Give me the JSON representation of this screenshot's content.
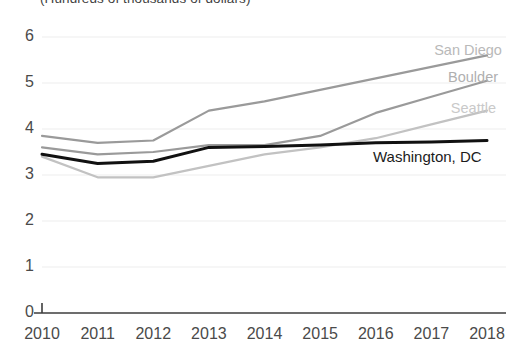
{
  "caption": {
    "units_text": "(Hundreds of thousands of dollars)"
  },
  "chart_data": {
    "type": "line",
    "title": "",
    "subtitle": "(Hundreds of thousands of dollars)",
    "xlabel": "",
    "ylabel": "",
    "x": [
      2010,
      2011,
      2012,
      2013,
      2014,
      2015,
      2016,
      2017,
      2018
    ],
    "categories": [
      "2010",
      "2011",
      "2012",
      "2013",
      "2014",
      "2015",
      "2016",
      "2017",
      "2018"
    ],
    "xlim": [
      2010,
      2018
    ],
    "ylim": [
      0,
      6
    ],
    "yticks": [
      0,
      1,
      2,
      3,
      4,
      5,
      6
    ],
    "ytick_labels": [
      "0",
      "1",
      "2",
      "3",
      "4",
      "5",
      "6"
    ],
    "grid": "horizontal",
    "legend_position": "inline-right",
    "series": [
      {
        "name": "San Diego",
        "color": "#9a9a9a",
        "label_color": "#b9b9b9",
        "width": 2.2,
        "values": [
          3.85,
          3.7,
          3.75,
          4.4,
          4.6,
          4.85,
          5.1,
          5.35,
          5.6
        ]
      },
      {
        "name": "Boulder",
        "color": "#9a9a9a",
        "label_color": "#b0b0b0",
        "width": 2.2,
        "values": [
          3.6,
          3.45,
          3.5,
          3.65,
          3.65,
          3.85,
          4.35,
          4.7,
          5.05
        ]
      },
      {
        "name": "Seattle",
        "color": "#c2c2c2",
        "label_color": "#c9c9c9",
        "width": 2.2,
        "values": [
          3.4,
          2.95,
          2.95,
          3.2,
          3.45,
          3.6,
          3.8,
          4.1,
          4.4
        ]
      },
      {
        "name": "Washington, DC",
        "color": "#111111",
        "label_color": "#1b1b1b",
        "width": 3.0,
        "values": [
          3.45,
          3.25,
          3.3,
          3.6,
          3.62,
          3.65,
          3.7,
          3.72,
          3.75
        ]
      }
    ],
    "annotations": [
      {
        "text": "San Diego",
        "x": 2017.05,
        "y": 5.72
      },
      {
        "text": "Boulder",
        "x": 2017.3,
        "y": 5.12
      },
      {
        "text": "Seattle",
        "x": 2017.35,
        "y": 4.45
      },
      {
        "text": "Washington, DC",
        "x": 2015.95,
        "y": 3.4
      }
    ]
  },
  "axis": {
    "y_tick_labels": [
      "6",
      "5",
      "4",
      "3",
      "2",
      "1",
      "0"
    ],
    "x_tick_labels": [
      "2010",
      "2011",
      "2012",
      "2013",
      "2014",
      "2015",
      "2016",
      "2017",
      "2018"
    ]
  },
  "colors": {
    "axis_line": "#3d3d3d",
    "gridline": "#ededed",
    "tick_text": "#4a4a4a",
    "background": "#ffffff"
  }
}
